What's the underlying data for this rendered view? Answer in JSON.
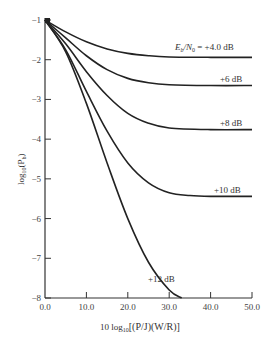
{
  "chart_data": {
    "type": "line",
    "title": "",
    "xlabel": "10 log10[(P/J)(W/R)]",
    "ylabel": "log10(Pb)",
    "xlim": [
      0,
      50
    ],
    "ylim": [
      -8,
      -1
    ],
    "grid": false,
    "legend_position": "inline labels at right end of curves",
    "x_ticks": [
      "0.0",
      "10.0",
      "20.0",
      "30.0",
      "40.0",
      "50.0"
    ],
    "y_ticks": [
      "-1",
      "-2",
      "-3",
      "-4",
      "-5",
      "-6",
      "-7",
      "-8"
    ],
    "series": [
      {
        "name": "Eb/N0 = +4.0 dB",
        "label": "E_b/N_0 = +4.0 dB",
        "x": [
          0,
          5,
          10,
          15,
          20,
          25,
          30,
          40,
          50
        ],
        "y": [
          -1,
          -1.3,
          -1.55,
          -1.73,
          -1.84,
          -1.9,
          -1.93,
          -1.94,
          -1.94
        ]
      },
      {
        "name": "+6 dB",
        "label": "+6 dB",
        "x": [
          0,
          5,
          10,
          15,
          20,
          25,
          30,
          40,
          50
        ],
        "y": [
          -1,
          -1.45,
          -1.9,
          -2.25,
          -2.47,
          -2.58,
          -2.63,
          -2.65,
          -2.65
        ]
      },
      {
        "name": "+8 dB",
        "label": "+8 dB",
        "x": [
          0,
          5,
          10,
          15,
          20,
          25,
          30,
          40,
          50
        ],
        "y": [
          -1,
          -1.6,
          -2.3,
          -2.9,
          -3.35,
          -3.6,
          -3.72,
          -3.76,
          -3.76
        ]
      },
      {
        "name": "+10 dB",
        "label": "+10 dB",
        "x": [
          0,
          5,
          10,
          15,
          20,
          25,
          30,
          35,
          40,
          50
        ],
        "y": [
          -1,
          -1.75,
          -2.8,
          -3.8,
          -4.6,
          -5.1,
          -5.35,
          -5.42,
          -5.44,
          -5.44
        ]
      },
      {
        "name": "+12 dB",
        "label": "+12 dB",
        "x": [
          0,
          5,
          10,
          15,
          20,
          25,
          30,
          33
        ],
        "y": [
          -1,
          -1.8,
          -3.1,
          -4.6,
          -6.0,
          -7.1,
          -7.8,
          -8.0
        ]
      }
    ]
  },
  "labels": {
    "curve_4": {
      "prefix_e": "E",
      "sub_b": "b",
      "slash_n": "/N",
      "sub_0": "0",
      "suffix": " = +4.0 dB"
    },
    "curve_6": "+6 dB",
    "curve_8": "+8 dB",
    "curve_10": "+10 dB",
    "curve_12": "+12 dB",
    "ylabel_main": "log",
    "ylabel_sub": "10",
    "ylabel_paren": "(P",
    "ylabel_psub": "b",
    "ylabel_close": ")",
    "xlabel_prefix": "10 log",
    "xlabel_sub": "10",
    "xlabel_body": "[(P/J)(W/R)]"
  }
}
